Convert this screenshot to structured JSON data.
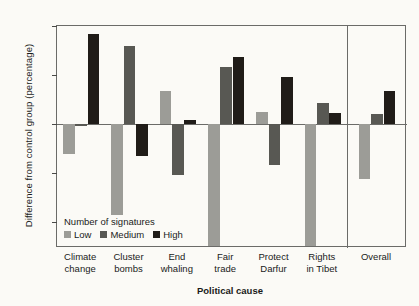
{
  "chart_data": {
    "type": "bar",
    "title": "",
    "xlabel": "Political cause",
    "ylabel": "Difference from control group (percentage)",
    "categories": [
      "Climate change",
      "Cluster bombs",
      "End whaling",
      "Fair trade",
      "Protect Darfur",
      "Rights in Tibet",
      "Overall"
    ],
    "category_lines": [
      [
        "Climate",
        "change"
      ],
      [
        "Cluster",
        "bombs"
      ],
      [
        "End",
        "whaling"
      ],
      [
        "Fair",
        "trade"
      ],
      [
        "Protect",
        "Darfur"
      ],
      [
        "Rights",
        "in Tibet"
      ],
      [
        "Overall",
        ""
      ]
    ],
    "series": [
      {
        "name": "Low",
        "color": "#9c9c97",
        "values": [
          -1.5,
          -4.6,
          1.7,
          -6.2,
          0.6,
          -6.2,
          -2.8
        ]
      },
      {
        "name": "Medium",
        "color": "#585853",
        "values": [
          -0.1,
          4.0,
          -2.6,
          2.9,
          -2.1,
          1.1,
          0.5
        ]
      },
      {
        "name": "High",
        "color": "#201c18",
        "values": [
          4.6,
          -1.6,
          0.2,
          3.4,
          2.4,
          0.55,
          1.7
        ]
      }
    ],
    "ylim": [
      -6.3,
      5.0
    ],
    "yticks": [
      5.0,
      2.5,
      0,
      -2.5,
      -5.0
    ],
    "ytick_labels": [
      "5.0",
      "2.5",
      "0",
      "−2.5",
      "−5.0"
    ],
    "grid": false,
    "legend": {
      "title": "Number of signatures",
      "position": "inside-bottom-left",
      "entries": [
        {
          "label": "Low",
          "color": "#9c9c97"
        },
        {
          "label": "Medium",
          "color": "#585853"
        },
        {
          "label": "High",
          "color": "#201c18"
        }
      ]
    },
    "panel_separator_after_category": "Rights in Tibet"
  }
}
